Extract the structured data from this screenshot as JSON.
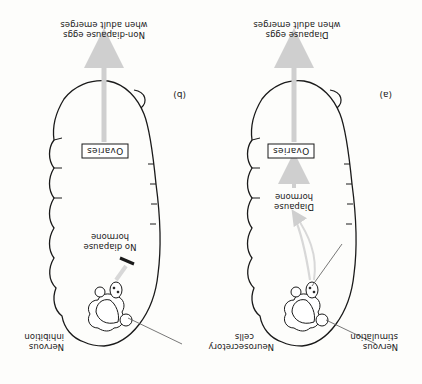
{
  "figure": {
    "orientation": "rotated 180 degrees",
    "colors": {
      "outline": "#1a1a1a",
      "arrow": "#cfcfcf",
      "background": "#fdfdfb"
    },
    "panels": [
      {
        "id": "a",
        "label": "(a)",
        "labels": {
          "neurosecretory_line1": "Neurosecretory",
          "neurosecretory_line2": "cells",
          "nervous_line1": "Nervous",
          "nervous_line2": "stimulation",
          "hormone_line1": "Diapause",
          "hormone_line2": "hormone",
          "ovaries": "Ovaries",
          "eggs_line1": "Diapause eggs",
          "eggs_line2": "when adult emerges"
        }
      },
      {
        "id": "b",
        "label": "(b)",
        "labels": {
          "nervous_line1": "Nervous",
          "nervous_line2": "inhibition",
          "hormone_line1": "No diapause",
          "hormone_line2": "hormone",
          "ovaries": "Ovaries",
          "eggs_line1": "Non-diapause eggs",
          "eggs_line2": "when adult emerges"
        }
      }
    ]
  }
}
